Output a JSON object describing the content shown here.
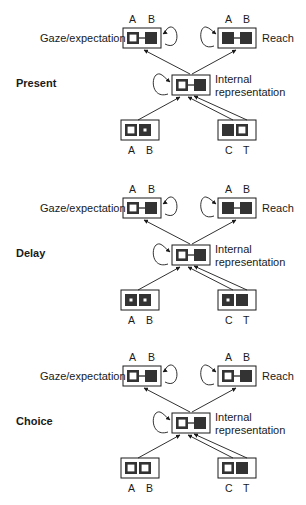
{
  "panels": [
    {
      "phase": "Present",
      "gaze": {
        "label": "Gaze/expectation",
        "A": "A",
        "B": "B",
        "states": [
          "open",
          "filled"
        ]
      },
      "reach": {
        "label": "Reach",
        "A": "A",
        "B": "B",
        "states": [
          "filled",
          "filled"
        ]
      },
      "internal": {
        "label_line1": "Internal",
        "label_line2": "representation",
        "states": [
          "open",
          "filled"
        ]
      },
      "input_left": {
        "A": "A",
        "B": "B",
        "states": [
          "open",
          "dot"
        ]
      },
      "input_right": {
        "C": "C",
        "T": "T",
        "states": [
          "filled",
          "open"
        ]
      }
    },
    {
      "phase": "Delay",
      "gaze": {
        "label": "Gaze/expectation",
        "A": "A",
        "B": "B",
        "states": [
          "open",
          "filled"
        ]
      },
      "reach": {
        "label": "Reach",
        "A": "A",
        "B": "B",
        "states": [
          "filled",
          "filled"
        ]
      },
      "internal": {
        "label_line1": "Internal",
        "label_line2": "representation",
        "states": [
          "open",
          "filled"
        ]
      },
      "input_left": {
        "A": "A",
        "B": "B",
        "states": [
          "dot",
          "dot"
        ]
      },
      "input_right": {
        "C": "C",
        "T": "T",
        "states": [
          "dot",
          "filled"
        ]
      }
    },
    {
      "phase": "Choice",
      "gaze": {
        "label": "Gaze/expectation",
        "A": "A",
        "B": "B",
        "states": [
          "open",
          "filled"
        ]
      },
      "reach": {
        "label": "Reach",
        "A": "A",
        "B": "B",
        "states": [
          "open",
          "filled"
        ]
      },
      "internal": {
        "label_line1": "Internal",
        "label_line2": "representation",
        "states": [
          "open",
          "filled"
        ]
      },
      "input_left": {
        "A": "A",
        "B": "B",
        "states": [
          "open",
          "open"
        ]
      },
      "input_right": {
        "C": "C",
        "T": "T",
        "states": [
          "open",
          "filled"
        ]
      }
    }
  ],
  "colors": {
    "ink": "#1a1a1a",
    "fill": "#333333",
    "bg": "#ffffff"
  }
}
